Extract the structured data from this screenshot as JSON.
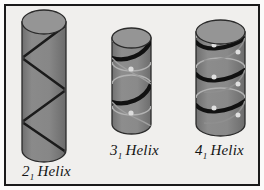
{
  "figure": {
    "kind": "scientific-illustration",
    "background_color": "#f0efed",
    "frame_color": "#1a1a1a",
    "outer_margin_color": "#fbfbfa"
  },
  "palette": {
    "cylinder_body_dark": "#7c7c7c",
    "cylinder_body_light": "#9a9a9a",
    "cylinder_top_fill": "#8d8d8d",
    "cylinder_outline": "#2b2b2b",
    "helix_front_stroke": "#111111",
    "helix_back_stroke": "#b5b5b5",
    "node_fill": "#e3e3e3",
    "text_color": "#141414"
  },
  "cylinders": [
    {
      "id": "helix-2-1",
      "label_number": "2",
      "label_subscript": "1",
      "label_word": "Helix",
      "label_full": "2₁ Helix",
      "x": 22,
      "y": 10,
      "width": 44,
      "height": 152,
      "ellipse_ry": 12,
      "turns": 2,
      "path_style": "zigzag",
      "vertex_count": 5,
      "node_count": 5
    },
    {
      "id": "helix-3-1",
      "label_number": "3",
      "label_subscript": "1",
      "label_word": "Helix",
      "label_full": "3₁ Helix",
      "x": 112,
      "y": 28,
      "width": 39,
      "height": 106,
      "ellipse_ry": 10,
      "turns": 2,
      "path_style": "helical-band",
      "node_count": 2
    },
    {
      "id": "helix-4-1",
      "label_number": "4",
      "label_subscript": "1",
      "label_word": "Helix",
      "label_full": "4₁ Helix",
      "x": 196,
      "y": 20,
      "width": 49,
      "height": 116,
      "ellipse_ry": 12,
      "turns": 3,
      "path_style": "helical-band",
      "node_count": 6
    }
  ]
}
